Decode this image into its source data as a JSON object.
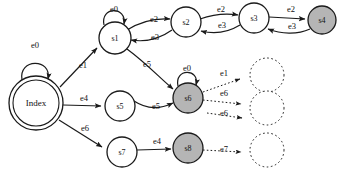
{
  "diagram": {
    "colors": {
      "stroke": "#1a1a1a",
      "node_fill_normal": "#ffffff",
      "node_fill_accept": "#b5b5b5",
      "node_fill_ghost": "#ffffff",
      "text": "#111111",
      "background": "#ffffff"
    },
    "nodes": [
      {
        "id": "index",
        "label": "Index",
        "shape": "double-circle",
        "fill": "normal",
        "cx": 36,
        "cy": 103,
        "r": 27,
        "font": 9
      },
      {
        "id": "s1",
        "label": "s1",
        "shape": "circle",
        "fill": "normal",
        "cx": 115,
        "cy": 38,
        "r": 16,
        "font": 8
      },
      {
        "id": "s2",
        "label": "s2",
        "shape": "circle",
        "fill": "normal",
        "cx": 186,
        "cy": 22,
        "r": 15,
        "font": 8
      },
      {
        "id": "s3",
        "label": "s3",
        "shape": "circle",
        "fill": "normal",
        "cx": 254,
        "cy": 18,
        "r": 15,
        "font": 8
      },
      {
        "id": "s4",
        "label": "s4",
        "shape": "circle",
        "fill": "accept",
        "cx": 322,
        "cy": 20,
        "r": 14,
        "font": 8
      },
      {
        "id": "s5",
        "label": "s5",
        "shape": "circle",
        "fill": "normal",
        "cx": 120,
        "cy": 106,
        "r": 15,
        "font": 8
      },
      {
        "id": "s6",
        "label": "s6",
        "shape": "circle",
        "fill": "accept",
        "cx": 188,
        "cy": 98,
        "r": 15,
        "font": 8
      },
      {
        "id": "s7",
        "label": "s7",
        "shape": "circle",
        "fill": "normal",
        "cx": 122,
        "cy": 152,
        "r": 15,
        "font": 8
      },
      {
        "id": "s8",
        "label": "s8",
        "shape": "circle",
        "fill": "accept",
        "cx": 188,
        "cy": 148,
        "r": 15,
        "font": 8
      },
      {
        "id": "g1",
        "label": "",
        "shape": "dotted-circle",
        "fill": "ghost",
        "cx": 267,
        "cy": 75,
        "r": 17,
        "font": 8
      },
      {
        "id": "g2",
        "label": "",
        "shape": "dotted-circle",
        "fill": "ghost",
        "cx": 267,
        "cy": 108,
        "r": 17,
        "font": 8
      },
      {
        "id": "g3",
        "label": "",
        "shape": "dotted-circle",
        "fill": "ghost",
        "cx": 267,
        "cy": 150,
        "r": 17,
        "font": 8
      }
    ],
    "edges": [
      {
        "from": "index",
        "to": "index",
        "label": "e0",
        "label_x": 31,
        "label_y": 48,
        "kind": "self"
      },
      {
        "from": "index",
        "to": "s1",
        "label": "e1",
        "label_x": 79,
        "label_y": 68,
        "kind": "line"
      },
      {
        "from": "index",
        "to": "s5",
        "label": "e4",
        "label_x": 80,
        "label_y": 101,
        "kind": "line"
      },
      {
        "from": "index",
        "to": "s7",
        "label": "e6",
        "label_x": 81,
        "label_y": 131,
        "kind": "line"
      },
      {
        "from": "s1",
        "to": "s1",
        "label": "e0",
        "label_x": 110,
        "label_y": 12,
        "kind": "self"
      },
      {
        "from": "s1",
        "to": "s2",
        "label": "e2",
        "label_x": 150,
        "label_y": 22,
        "kind": "curve"
      },
      {
        "from": "s2",
        "to": "s1",
        "label": "e3",
        "label_x": 151,
        "label_y": 40,
        "kind": "curve"
      },
      {
        "from": "s1",
        "to": "s6",
        "label": "e5",
        "label_x": 143,
        "label_y": 67,
        "kind": "curve"
      },
      {
        "from": "s5",
        "to": "s6",
        "label": "e5",
        "label_x": 152,
        "label_y": 109,
        "kind": "curve"
      },
      {
        "from": "s2",
        "to": "s3",
        "label": "e2",
        "label_x": 217,
        "label_y": 12,
        "kind": "curve"
      },
      {
        "from": "s3",
        "to": "s2",
        "label": "e3",
        "label_x": 218,
        "label_y": 28,
        "kind": "curve"
      },
      {
        "from": "s3",
        "to": "s4",
        "label": "e2",
        "label_x": 287,
        "label_y": 12,
        "kind": "curve"
      },
      {
        "from": "s4",
        "to": "s3",
        "label": "e3",
        "label_x": 288,
        "label_y": 29,
        "kind": "curve"
      },
      {
        "from": "s6",
        "to": "s6",
        "label": "e0",
        "label_x": 183,
        "label_y": 71,
        "kind": "self"
      },
      {
        "from": "s6",
        "to": "g1",
        "label": "e1",
        "label_x": 220,
        "label_y": 76,
        "kind": "ghost"
      },
      {
        "from": "s6",
        "to": "g2",
        "label": "e6",
        "label_x": 220,
        "label_y": 96,
        "kind": "ghost"
      },
      {
        "from": "g2",
        "to": "g2",
        "label": "e6",
        "label_x": 220,
        "label_y": 116,
        "kind": "ghost"
      },
      {
        "from": "s7",
        "to": "s8",
        "label": "e4",
        "label_x": 153,
        "label_y": 144,
        "kind": "line"
      },
      {
        "from": "s8",
        "to": "g3",
        "label": "e7",
        "label_x": 220,
        "label_y": 152,
        "kind": "ghost"
      }
    ],
    "events": [
      "e0",
      "e1",
      "e2",
      "e3",
      "e4",
      "e5",
      "e6",
      "e7"
    ]
  }
}
